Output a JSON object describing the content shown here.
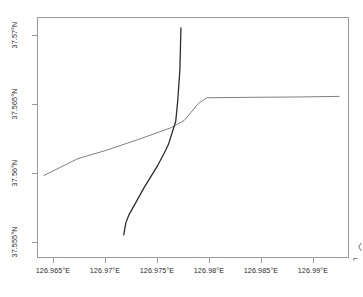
{
  "chart_data": {
    "type": "line",
    "title": "",
    "subtitle": "",
    "xlabel": "",
    "ylabel": "",
    "grid": false,
    "legend_position": "none",
    "xlim": [
      126.96346,
      126.99346
    ],
    "ylim": [
      37.55386,
      37.57129
    ],
    "x_tick_values": [
      126.965,
      126.97,
      126.975,
      126.98,
      126.985,
      126.99
    ],
    "x_tick_labels": [
      "126.965°E",
      "126.97°E",
      "126.975°E",
      "126.98°E",
      "126.985°E",
      "126.99°E"
    ],
    "y_tick_values": [
      37.57,
      37.565,
      37.56,
      37.555
    ],
    "y_tick_labels": [
      "37.57°N",
      "37.565°N",
      "37.56°N",
      "37.555°N"
    ],
    "series": [
      {
        "name": "route-gray",
        "color": "#808080",
        "width": 1.0,
        "points": [
          [
            126.96413,
            37.55983
          ],
          [
            126.9674,
            37.56105
          ],
          [
            126.97,
            37.56162
          ],
          [
            126.9732,
            37.56243
          ],
          [
            126.9764,
            37.5633
          ],
          [
            126.9776,
            37.5638
          ],
          [
            126.979,
            37.56505
          ],
          [
            126.9798,
            37.56545
          ],
          [
            126.984,
            37.56548
          ],
          [
            126.989,
            37.56551
          ],
          [
            126.9925,
            37.56555
          ]
        ]
      },
      {
        "name": "route-dark",
        "color": "#2e2e2e",
        "width": 1.3,
        "points": [
          [
            126.9718,
            37.55553
          ],
          [
            126.972,
            37.5564
          ],
          [
            126.9723,
            37.55698
          ],
          [
            126.9738,
            37.559
          ],
          [
            126.9751,
            37.5606
          ],
          [
            126.9758,
            37.5616
          ],
          [
            126.9761,
            37.56208
          ],
          [
            126.9768,
            37.56375
          ],
          [
            126.977,
            37.5653
          ],
          [
            126.9772,
            37.5675
          ],
          [
            126.9773,
            37.5705
          ]
        ]
      }
    ]
  },
  "edge_text": {
    "line1": "〈",
    "line2": "⌐"
  }
}
